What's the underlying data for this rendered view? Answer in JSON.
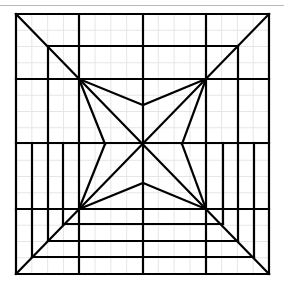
{
  "diagram": {
    "title": "",
    "colors": {
      "line": "#000000",
      "grid": "#e6e6e6",
      "separator": "#b8b8b8",
      "background": "#ffffff"
    },
    "frame": {
      "x1": 16,
      "y1": 14,
      "x2": 269,
      "y2": 274
    },
    "grid_divisions": 16,
    "horizontal_lines": [
      {
        "y": 14,
        "x1": 16,
        "x2": 269
      },
      {
        "y": 46,
        "x1": 48,
        "x2": 238
      },
      {
        "y": 79,
        "x1": 16,
        "x2": 269
      },
      {
        "y": 143,
        "x1": 16,
        "x2": 269
      },
      {
        "y": 209,
        "x1": 16,
        "x2": 269
      },
      {
        "y": 224,
        "x1": 63,
        "x2": 223
      },
      {
        "y": 241,
        "x1": 48,
        "x2": 238
      },
      {
        "y": 257,
        "x1": 32,
        "x2": 254
      },
      {
        "y": 274,
        "x1": 16,
        "x2": 269
      }
    ],
    "vertical_lines": [
      {
        "x": 16,
        "y1": 14,
        "y2": 274
      },
      {
        "x": 32,
        "y1": 143,
        "y2": 257
      },
      {
        "x": 48,
        "y1": 46,
        "y2": 241
      },
      {
        "x": 63,
        "y1": 143,
        "y2": 224
      },
      {
        "x": 79,
        "y1": 14,
        "y2": 274
      },
      {
        "x": 143,
        "y1": 14,
        "y2": 274
      },
      {
        "x": 206,
        "y1": 14,
        "y2": 274
      },
      {
        "x": 223,
        "y1": 143,
        "y2": 224
      },
      {
        "x": 238,
        "y1": 46,
        "y2": 241
      },
      {
        "x": 254,
        "y1": 143,
        "y2": 257
      },
      {
        "x": 269,
        "y1": 14,
        "y2": 274
      }
    ],
    "diagonals": [
      {
        "x1": 16,
        "y1": 14,
        "x2": 269,
        "y2": 274
      },
      {
        "x1": 269,
        "y1": 14,
        "x2": 16,
        "y2": 274
      }
    ],
    "star": {
      "outer_nodes": [
        [
          79,
          79
        ],
        [
          206,
          79
        ],
        [
          206,
          209
        ],
        [
          79,
          209
        ]
      ],
      "inner_points": [
        [
          143,
          105
        ],
        [
          182,
          144
        ],
        [
          143,
          183
        ],
        [
          105,
          144
        ]
      ],
      "center": [
        143,
        144
      ]
    }
  }
}
